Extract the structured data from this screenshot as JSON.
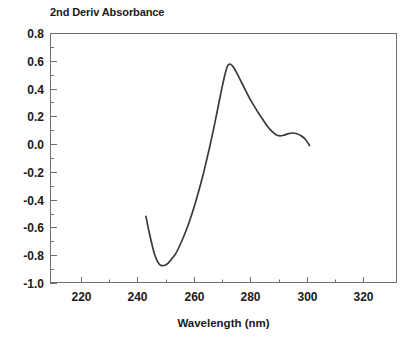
{
  "chart_data": {
    "type": "line",
    "title": "2nd Deriv Absorbance",
    "xlabel": "Wavelength (nm)",
    "ylabel": "",
    "xlim": [
      209,
      332
    ],
    "ylim": [
      -1.0,
      0.8
    ],
    "grid": false,
    "legend": null,
    "x_ticks": [
      220,
      240,
      260,
      280,
      300,
      320
    ],
    "x_tick_labels": [
      "220",
      "240",
      "260",
      "280",
      "300",
      "320"
    ],
    "x_minor_ticks": [
      230,
      250,
      270,
      290,
      310
    ],
    "y_ticks": [
      -1.0,
      -0.8,
      -0.6,
      -0.4,
      -0.2,
      0.0,
      0.2,
      0.4,
      0.6,
      0.8
    ],
    "y_tick_labels": [
      "-1.0",
      "-0.8",
      "-0.6",
      "-0.4",
      "-0.2",
      "0.0",
      "0.2",
      "0.4",
      "0.6",
      "0.8"
    ],
    "y_minor_ticks": [
      -0.9,
      -0.7,
      -0.5,
      -0.3,
      -0.1,
      0.1,
      0.3,
      0.5,
      0.7
    ],
    "series": [
      {
        "name": "2nd derivative spectrum",
        "color": "#3a3a3a",
        "x": [
          243.0,
          244.0,
          245.0,
          246.0,
          247.0,
          248.0,
          249.0,
          250.0,
          251.0,
          252.0,
          253.5,
          255.0,
          256.5,
          258.0,
          259.5,
          261.0,
          262.5,
          264.0,
          265.5,
          267.0,
          268.5,
          270.0,
          271.0,
          272.0,
          273.0,
          274.0,
          275.5,
          277.0,
          278.5,
          280.0,
          281.5,
          283.0,
          284.5,
          286.0,
          287.5,
          289.0,
          290.5,
          292.0,
          293.5,
          295.0,
          296.5,
          298.0,
          299.5,
          301.0
        ],
        "y": [
          -0.52,
          -0.62,
          -0.71,
          -0.79,
          -0.84,
          -0.87,
          -0.875,
          -0.87,
          -0.855,
          -0.83,
          -0.79,
          -0.73,
          -0.66,
          -0.58,
          -0.49,
          -0.39,
          -0.28,
          -0.16,
          -0.03,
          0.11,
          0.26,
          0.41,
          0.5,
          0.565,
          0.575,
          0.555,
          0.5,
          0.44,
          0.38,
          0.32,
          0.27,
          0.22,
          0.175,
          0.13,
          0.095,
          0.07,
          0.06,
          0.065,
          0.075,
          0.08,
          0.075,
          0.06,
          0.035,
          -0.01
        ]
      }
    ]
  },
  "plot_geometry": {
    "left_px": 50,
    "right_px": 397,
    "top_px": 33,
    "bottom_px": 283
  },
  "colors": {
    "frame": "#6e6e6e",
    "curve": "#3a3a3a",
    "text": "#1a1a1a",
    "background": "#ffffff"
  }
}
